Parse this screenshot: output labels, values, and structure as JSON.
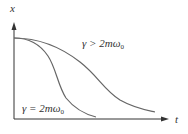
{
  "diagram": {
    "axes": {
      "y_label": "x",
      "x_label": "t"
    },
    "curves": [
      {
        "name": "critical-damping",
        "label": "γ = 2mω",
        "label_sub": "0"
      },
      {
        "name": "overdamping",
        "label": "γ > 2mω",
        "label_sub": "0"
      }
    ],
    "colors": {
      "axis": "#333333",
      "curve": "#666666",
      "text": "#333333"
    }
  }
}
